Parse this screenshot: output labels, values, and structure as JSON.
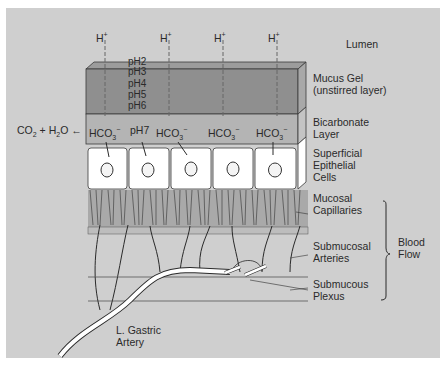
{
  "diagram": {
    "region_labels": {
      "lumen": "Lumen",
      "mucus_gel_1": "Mucus Gel",
      "mucus_gel_2": "(unstirred layer)",
      "bicarbonate_1": "Bicarbonate",
      "bicarbonate_2": "Layer",
      "epithelial_1": "Superficial",
      "epithelial_2": "Epithelial",
      "epithelial_3": "Cells",
      "capillaries_1": "Mucosal",
      "capillaries_2": "Capillaries",
      "arteries_1": "Submucosal",
      "arteries_2": "Arteries",
      "plexus_1": "Submucous",
      "plexus_2": "Plexus",
      "blood_flow_1": "Blood",
      "blood_flow_2": "Flow",
      "gastric_1": "L. Gastric",
      "gastric_2": "Artery"
    },
    "ions": {
      "h_plus": "H",
      "h_plus_sup": "+",
      "hco3": "HCO",
      "hco3_sub": "3",
      "hco3_sup": "−"
    },
    "ph_gradient": [
      "pH2",
      "pH3",
      "pH4",
      "pH5",
      "pH6"
    ],
    "ph7": "pH7",
    "reaction": {
      "co2": "CO",
      "co2_sub": "2",
      "plus": "+",
      "h2o_h": "H",
      "h2o_sub": "2",
      "h2o_o": "O"
    },
    "colors": {
      "background": "#cfcfcf",
      "mucus_gel": "#8f8f8f",
      "bicarbonate": "#b4b4b4",
      "cells": "#ffffff",
      "line": "#2a2a2a"
    }
  }
}
